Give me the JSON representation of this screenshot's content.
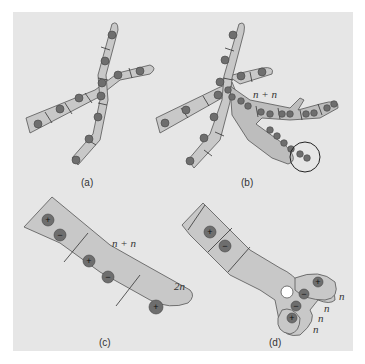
{
  "figure": {
    "panels": [
      {
        "id": "a",
        "label": "(a)"
      },
      {
        "id": "b",
        "label": "(b)",
        "annotation": "n + n"
      },
      {
        "id": "c",
        "label": "(c)",
        "annotations": [
          "n + n",
          "2n"
        ]
      },
      {
        "id": "d",
        "label": "(d)",
        "annotations": [
          "n",
          "n",
          "n",
          "n"
        ]
      }
    ],
    "signs": {
      "plus": "+",
      "minus": "−"
    },
    "colors": {
      "background": "#e6e6e6",
      "hypha": "#c8c8c8",
      "nucleus": "#6e6e6e"
    }
  }
}
